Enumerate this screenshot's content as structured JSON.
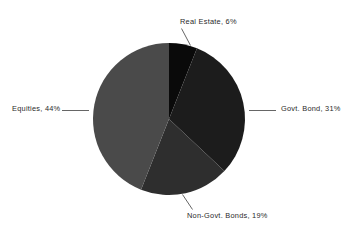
{
  "chart_data": {
    "type": "pie",
    "title": "",
    "subtitle": "",
    "xlabel": "",
    "ylabel": "",
    "legend_position": "none",
    "grid": false,
    "labels_position": "outside-with-leader-lines",
    "total_percent": "100%",
    "categories": [
      "Real Estate",
      "Govt. Bond",
      "Non-Govt. Bonds",
      "Equities"
    ],
    "values": [
      6,
      31,
      19,
      44
    ],
    "slices": [
      {
        "name": "Real Estate",
        "value": 6,
        "percent_text": "6%",
        "label": "Real Estate, 6%",
        "color": "#0a0a0a",
        "start_angle_deg": 0,
        "end_angle_deg": 21.6,
        "leader": "diagonal-up-left"
      },
      {
        "name": "Govt. Bond",
        "value": 31,
        "percent_text": "31%",
        "label": "Govt. Bond, 31%",
        "color": "#1c1c1c",
        "start_angle_deg": 21.6,
        "end_angle_deg": 133.2,
        "leader": "horizontal-right"
      },
      {
        "name": "Non-Govt. Bonds",
        "value": 19,
        "percent_text": "19%",
        "label": "Non-Govt. Bonds, 19%",
        "color": "#2e2e2e",
        "start_angle_deg": 133.2,
        "end_angle_deg": 201.6,
        "leader": "diagonal-down-right"
      },
      {
        "name": "Equities",
        "value": 44,
        "percent_text": "44%",
        "label": "Equities, 44%",
        "color": "#4a4a4a",
        "start_angle_deg": 201.6,
        "end_angle_deg": 360,
        "leader": "horizontal-left"
      }
    ],
    "geometry": {
      "center_x": 169,
      "center_y": 119,
      "radius": 76
    },
    "background_color": "#ffffff",
    "label_color": "#2a2a2a",
    "leader_line_color": "#555555"
  }
}
